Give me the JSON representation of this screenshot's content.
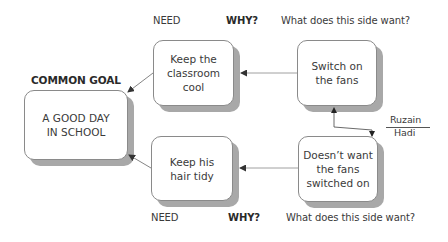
{
  "diagram": {
    "type": "conflict-resolution-diagram",
    "common_goal": {
      "heading": "COMMON GOAL",
      "text_line1": "A GOOD DAY",
      "text_line2": "IN SCHOOL"
    },
    "top_row": {
      "need_label": "NEED",
      "why_label": "WHY?",
      "want_label": "What does this side want?",
      "need": {
        "line1": "Keep the",
        "line2": "classroom cool"
      },
      "want": {
        "line1": "Switch on",
        "line2": "the fans"
      }
    },
    "bottom_row": {
      "need_label": "NEED",
      "why_label": "WHY?",
      "want_label": "What does this side want?",
      "need": {
        "line1": "Keep his",
        "line2": "hair tidy"
      },
      "want": {
        "line1": "Doesn’t want",
        "line2": "the fans",
        "line3": "switched on"
      }
    },
    "conflict": {
      "party_top": "Ruzain",
      "party_bottom": "Hadi"
    },
    "colors": {
      "box_border": "#8a8a8a",
      "box_shadow": "#a8a8a8",
      "arrow": "#555555",
      "text": "#3a3a3a"
    }
  }
}
